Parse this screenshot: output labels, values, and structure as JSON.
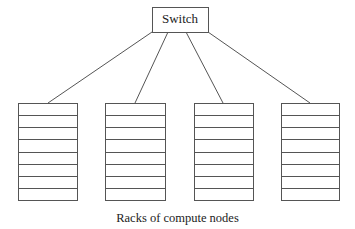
{
  "switch": {
    "label": "Switch",
    "x": 152,
    "y": 7,
    "w": 56,
    "h": 25
  },
  "caption": "Racks of compute nodes",
  "colors": {
    "stroke": "#555555",
    "text": "#222222",
    "background": "#ffffff"
  },
  "racks": [
    {
      "name": "rack-1",
      "x": 18,
      "y": 103,
      "w": 59,
      "h": 97,
      "units": 8,
      "attach_x": 48
    },
    {
      "name": "rack-2",
      "x": 105,
      "y": 103,
      "w": 60,
      "h": 97,
      "units": 8,
      "attach_x": 135
    },
    {
      "name": "rack-3",
      "x": 194,
      "y": 103,
      "w": 59,
      "h": 97,
      "units": 8,
      "attach_x": 223
    },
    {
      "name": "rack-4",
      "x": 281,
      "y": 103,
      "w": 58,
      "h": 97,
      "units": 8,
      "attach_x": 310
    }
  ],
  "links": [
    {
      "from": [
        152,
        32
      ],
      "to": [
        48,
        103
      ]
    },
    {
      "from": [
        168,
        32
      ],
      "to": [
        135,
        103
      ]
    },
    {
      "from": [
        186,
        32
      ],
      "to": [
        223,
        103
      ]
    },
    {
      "from": [
        208,
        32
      ],
      "to": [
        310,
        103
      ]
    }
  ]
}
